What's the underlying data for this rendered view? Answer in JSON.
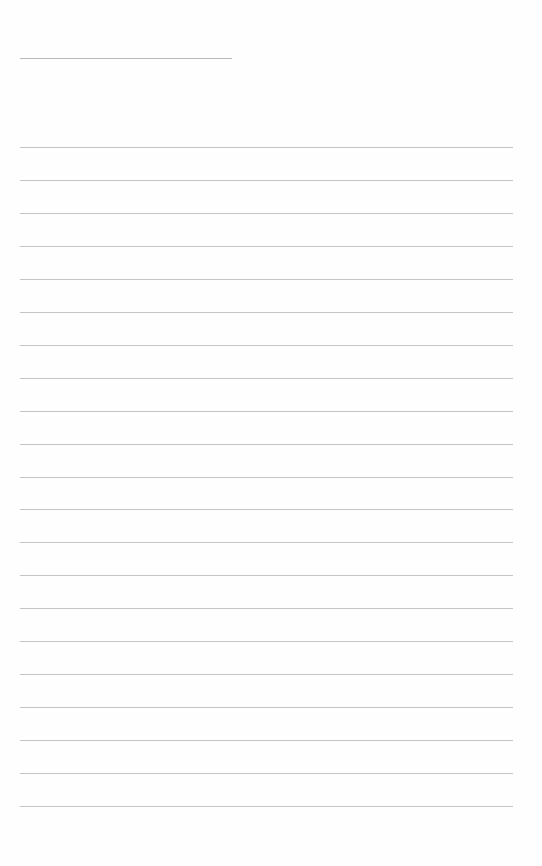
{
  "document": {
    "type": "blank-lined-paper",
    "header_line": {
      "x": 20,
      "y": 58,
      "width": 212
    },
    "ruled_lines": {
      "count": 21,
      "first_y": 147,
      "spacing": 32.95,
      "x": 20,
      "width": 493
    },
    "colors": {
      "background": "#fefefe",
      "header_line": "#b8b8b8",
      "ruled_line": "#c4c4c4"
    }
  }
}
